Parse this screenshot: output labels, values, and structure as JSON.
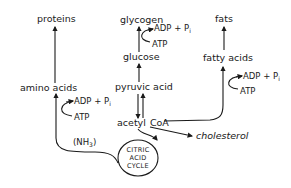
{
  "diagram": {
    "type": "metabolic-pathway",
    "nodes": {
      "proteins": "proteins",
      "amino_acids": "amino acids",
      "glycogen": "glycogen",
      "glucose": "glucose",
      "pyruvic_acid": "pyruvic acid",
      "acetyl_coa_1": "acetyl",
      "acetyl_coa_2": "CoA",
      "fats": "fats",
      "fatty_acids": "fatty acids",
      "cholesterol": "cholesterol",
      "ammonia": "(NH",
      "ammonia_sub": "3",
      "ammonia_close": ")",
      "cycle_1": "CITRIC",
      "cycle_2": "ACID",
      "cycle_3": "CYCLE"
    },
    "energy": {
      "adp": "ADP + P",
      "adp_sub": "i",
      "atp": "ATP"
    },
    "edges": [
      {
        "from": "amino acids",
        "to": "proteins",
        "cofactors": [
          "ATP",
          "ADP + Pi"
        ]
      },
      {
        "from": "glucose",
        "to": "glycogen",
        "cofactors": [
          "ATP",
          "ADP + Pi"
        ]
      },
      {
        "from": "pyruvic acid",
        "to": "glucose"
      },
      {
        "from": "pyruvic acid",
        "to": "acetyl CoA"
      },
      {
        "from": "acetyl CoA",
        "to": "pyruvic acid"
      },
      {
        "from": "acetyl CoA",
        "to": "citric acid cycle"
      },
      {
        "from": "acetyl CoA",
        "to": "cholesterol"
      },
      {
        "from": "acetyl CoA",
        "to": "fatty acids",
        "cofactors": [
          "ATP",
          "ADP + Pi"
        ]
      },
      {
        "from": "fatty acids",
        "to": "fats"
      },
      {
        "from": "citric acid cycle",
        "to": "amino acids",
        "label": "(NH3)"
      }
    ]
  }
}
